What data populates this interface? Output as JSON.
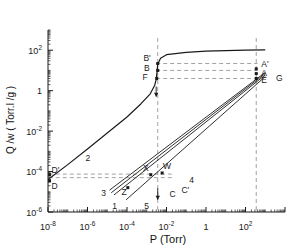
{
  "figure": {
    "background": "#ffffff",
    "line_color": "#1a1a1a",
    "dash_color": "#7a7a7a"
  },
  "chart_data": {
    "type": "line",
    "title": "",
    "xlabel": "P (Torr)",
    "ylabel": "Q /w ( Torr.l /g )",
    "xscale": "log",
    "yscale": "log",
    "xlim": [
      1e-08,
      10000.0
    ],
    "ylim": [
      1e-06,
      1000.0
    ],
    "grid": false,
    "legend": "none",
    "xticks": [
      {
        "value": 1e-08,
        "label": "10",
        "exp": "-8"
      },
      {
        "value": 1e-06,
        "label": "10",
        "exp": "-6"
      },
      {
        "value": 0.0001,
        "label": "10",
        "exp": "-4"
      },
      {
        "value": 0.01,
        "label": "10",
        "exp": "-2"
      },
      {
        "value": 1,
        "label": "1",
        "exp": ""
      },
      {
        "value": 100,
        "label": "10",
        "exp": "2"
      }
    ],
    "yticks": [
      {
        "value": 100,
        "label": "10",
        "exp": "2"
      },
      {
        "value": 1,
        "label": "1",
        "exp": ""
      },
      {
        "value": 0.01,
        "label": "10",
        "exp": "-2"
      },
      {
        "value": 0.0001,
        "label": "10",
        "exp": "-4"
      },
      {
        "value": 1e-06,
        "label": "10",
        "exp": "-6"
      }
    ],
    "series": [
      {
        "name": "2",
        "comment": "main adsorption isotherm: steep rise then saturation plateau",
        "points": [
          [
            1e-08,
            4e-05
          ],
          [
            1e-07,
            0.00022
          ],
          [
            1e-06,
            0.0013
          ],
          [
            1e-05,
            0.008
          ],
          [
            0.0001,
            0.05
          ],
          [
            0.0005,
            0.22
          ],
          [
            0.0015,
            0.7
          ],
          [
            0.0025,
            1.8
          ],
          [
            0.003,
            3.5
          ],
          [
            0.0033,
            8.0
          ],
          [
            0.0036,
            20.0
          ],
          [
            0.005,
            40.0
          ],
          [
            0.01,
            60.0
          ],
          [
            0.1,
            78.0
          ],
          [
            1.0,
            90.0
          ],
          [
            100.0,
            100.0
          ],
          [
            1000.0,
            105.0
          ]
        ]
      },
      {
        "name": "3",
        "comment": "lower-left straight desorption branch, leftmost of the fan",
        "points": [
          [
            1.3e-05,
            1.2e-05
          ],
          [
            1000.0,
            8.0
          ]
        ]
      },
      {
        "name": "1",
        "comment": "straight branch through Z up to A",
        "points": [
          [
            2.2e-05,
            7e-06
          ],
          [
            1000.0,
            6.0
          ]
        ]
      },
      {
        "name": "5",
        "comment": "rightmost lower straight branch",
        "points": [
          [
            9e-05,
            4e-06
          ],
          [
            1000.0,
            5.0
          ]
        ]
      },
      {
        "name": "4",
        "comment": "straight branch labelled 4 near C'",
        "points": [
          [
            1.6e-05,
            9e-06
          ],
          [
            1000.0,
            7.0
          ]
        ]
      }
    ],
    "markers": [
      {
        "label": "B'",
        "x": 0.0036,
        "y": 22.0
      },
      {
        "label": "B",
        "x": 0.0036,
        "y": 10.0
      },
      {
        "label": "F",
        "x": 0.0032,
        "y": 4.0
      },
      {
        "label": "A'",
        "x": 350.0,
        "y": 12.0
      },
      {
        "label": "A",
        "x": 350.0,
        "y": 7.0
      },
      {
        "label": "E",
        "x": 350.0,
        "y": 4.0
      },
      {
        "label": "G",
        "x": 2500.0,
        "y": 4.0
      },
      {
        "label": "D'",
        "x": 1.2e-08,
        "y": 7e-05
      },
      {
        "label": "D",
        "x": 1.2e-08,
        "y": 3.5e-05
      },
      {
        "label": "X",
        "x": 0.0016,
        "y": 7e-05
      },
      {
        "label": "W",
        "x": 0.006,
        "y": 8.5e-05
      },
      {
        "label": "Z",
        "x": 0.00011,
        "y": 1.6e-05
      },
      {
        "label": "C",
        "x": 0.014,
        "y": 1.5e-05
      },
      {
        "label": "C'",
        "x": 0.04,
        "y": 1.8e-05
      },
      {
        "label": "3",
        "x": 2.2e-05,
        "y": 1e-05
      },
      {
        "label": "1",
        "x": 5e-05,
        "y": 3e-06
      },
      {
        "label": "5",
        "x": 0.0006,
        "y": 3e-06
      },
      {
        "label": "4",
        "x": 0.1,
        "y": 3.5e-05
      },
      {
        "label": "2",
        "x": 8e-07,
        "y": 0.0005
      }
    ],
    "guide_lines": [
      {
        "name": "vertical-at-B",
        "orientation": "vertical",
        "x": 0.0036
      },
      {
        "name": "vertical-at-A",
        "orientation": "vertical",
        "x": 350.0
      },
      {
        "name": "horizontal-B-prime",
        "orientation": "horizontal",
        "y": 22.0
      },
      {
        "name": "horizontal-B",
        "orientation": "horizontal",
        "y": 10.0
      },
      {
        "name": "horizontal-F",
        "orientation": "horizontal",
        "y": 4.0
      },
      {
        "name": "horizontal-D",
        "orientation": "horizontal",
        "y": 5e-05
      },
      {
        "name": "horizontal-X",
        "orientation": "horizontal",
        "y": 7.5e-05
      }
    ],
    "arrows": [
      {
        "name": "down-arrow-on-curve",
        "x": 0.003,
        "y_from": 1.6,
        "y_to": 0.5
      },
      {
        "name": "down-arrow-vertical-guide",
        "x": 0.0036,
        "y_from": 1.5e-05,
        "y_to": 4e-06
      }
    ]
  },
  "axis_labels": {
    "x_title": "P (Torr)",
    "y_title": "Q /w ( Torr.l /g )"
  }
}
